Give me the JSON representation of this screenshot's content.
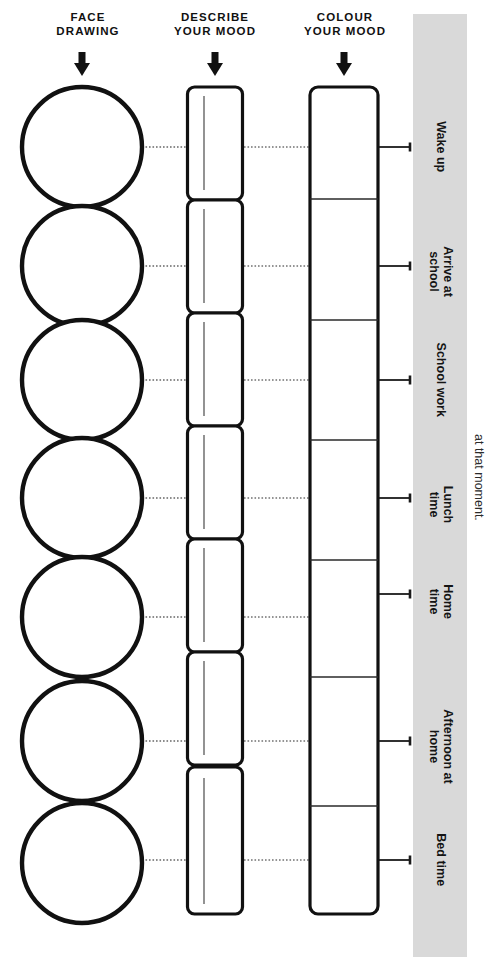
{
  "page": {
    "width": 498,
    "height": 957,
    "background": "#ffffff",
    "panel_color": "#d9d9d9",
    "ink_color": "#111111"
  },
  "headers": {
    "face_drawing": "FACE\nDRAWING",
    "describe_mood": "DESCRIBE\nYOUR MOOD",
    "colour_mood": "COLOUR\nYOUR MOOD"
  },
  "arrows": {
    "face": "down-arrow",
    "describe": "down-arrow",
    "colour": "down-arrow"
  },
  "note": {
    "text": "at that moment."
  },
  "rows": [
    {
      "label": "Wake up",
      "face": "",
      "mood": "",
      "colour": ""
    },
    {
      "label": "Arrive at\nschool",
      "face": "",
      "mood": "",
      "colour": ""
    },
    {
      "label": "School work",
      "face": "",
      "mood": "",
      "colour": ""
    },
    {
      "label": "Lunch\ntime",
      "face": "",
      "mood": "",
      "colour": ""
    },
    {
      "label": "Home\ntime",
      "face": "",
      "mood": "",
      "colour": ""
    },
    {
      "label": "Afternoon at\nhome",
      "face": "",
      "mood": "",
      "colour": ""
    },
    {
      "label": "Bed time",
      "face": "",
      "mood": "",
      "colour": ""
    }
  ]
}
